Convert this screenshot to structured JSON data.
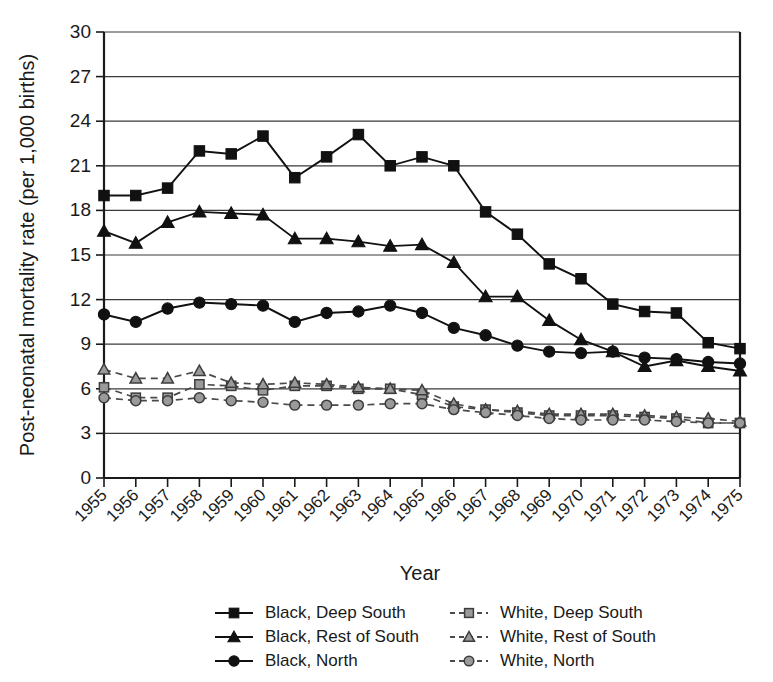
{
  "chart_data": {
    "type": "line",
    "title": "",
    "xlabel": "Year",
    "ylabel": "Post-neonatal mortality rate (per 1,000 births)",
    "x": [
      1955,
      1956,
      1957,
      1958,
      1959,
      1960,
      1961,
      1962,
      1963,
      1964,
      1965,
      1966,
      1967,
      1968,
      1969,
      1970,
      1971,
      1972,
      1973,
      1974,
      1975
    ],
    "categories": [
      "1955",
      "1956",
      "1957",
      "1958",
      "1959",
      "1960",
      "1961",
      "1962",
      "1963",
      "1964",
      "1965",
      "1966",
      "1967",
      "1968",
      "1969",
      "1970",
      "1971",
      "1972",
      "1973",
      "1974",
      "1975"
    ],
    "ylim": [
      0,
      30
    ],
    "yticks": [
      0,
      3,
      6,
      9,
      12,
      15,
      18,
      21,
      24,
      27,
      30
    ],
    "ytick_labels": [
      "0",
      "3",
      "6",
      "9",
      "12",
      "15",
      "18",
      "21",
      "24",
      "27",
      "30"
    ],
    "grid": "horizontal",
    "legend_position": "bottom",
    "series": [
      {
        "name": "Black, Deep South",
        "marker": "square",
        "style": "solid",
        "color": "#111111",
        "values": [
          19.0,
          19.0,
          19.5,
          22.0,
          21.8,
          23.0,
          20.2,
          21.6,
          23.1,
          21.0,
          21.6,
          21.0,
          17.9,
          16.4,
          14.4,
          13.4,
          11.7,
          11.2,
          11.1,
          9.1,
          8.7
        ]
      },
      {
        "name": "Black, Rest of South",
        "marker": "triangle",
        "style": "solid",
        "color": "#111111",
        "values": [
          16.6,
          15.8,
          17.2,
          17.9,
          17.8,
          17.7,
          16.1,
          16.1,
          15.9,
          15.6,
          15.7,
          14.5,
          12.2,
          12.2,
          10.6,
          9.3,
          8.5,
          7.5,
          7.9,
          7.5,
          7.2
        ]
      },
      {
        "name": "Black, North",
        "marker": "circle",
        "style": "solid",
        "color": "#111111",
        "values": [
          11.0,
          10.5,
          11.4,
          11.8,
          11.7,
          11.6,
          10.5,
          11.1,
          11.2,
          11.6,
          11.1,
          10.1,
          9.6,
          8.9,
          8.5,
          8.4,
          8.5,
          8.1,
          8.0,
          7.8,
          7.7
        ]
      },
      {
        "name": "White, Deep South",
        "marker": "square",
        "style": "dashed",
        "color": "#9a9a9a",
        "values": [
          6.1,
          5.4,
          5.4,
          6.3,
          6.2,
          5.9,
          6.2,
          6.2,
          6.0,
          6.0,
          5.6,
          4.8,
          4.6,
          4.4,
          4.2,
          4.2,
          4.2,
          4.1,
          4.0,
          3.7,
          3.7
        ]
      },
      {
        "name": "White, Rest of South",
        "marker": "triangle",
        "style": "dashed",
        "color": "#9a9a9a",
        "values": [
          7.3,
          6.7,
          6.7,
          7.2,
          6.4,
          6.3,
          6.4,
          6.3,
          6.1,
          6.0,
          5.9,
          5.0,
          4.6,
          4.5,
          4.3,
          4.3,
          4.3,
          4.2,
          4.1,
          4.0,
          3.8
        ]
      },
      {
        "name": "White, North",
        "marker": "circle",
        "style": "dashed",
        "color": "#9a9a9a",
        "values": [
          5.4,
          5.2,
          5.2,
          5.4,
          5.2,
          5.1,
          4.9,
          4.9,
          4.9,
          5.0,
          5.0,
          4.6,
          4.4,
          4.2,
          4.0,
          3.9,
          3.9,
          3.9,
          3.8,
          3.7,
          3.7
        ]
      }
    ]
  },
  "legend": {
    "items": [
      {
        "label": "Black, Deep South",
        "marker": "square",
        "style": "solid"
      },
      {
        "label": "Black, Rest of South",
        "marker": "triangle",
        "style": "solid"
      },
      {
        "label": "Black, North",
        "marker": "circle",
        "style": "solid"
      },
      {
        "label": "White, Deep South",
        "marker": "square",
        "style": "dashed"
      },
      {
        "label": "White, Rest of South",
        "marker": "triangle",
        "style": "dashed"
      },
      {
        "label": "White, North",
        "marker": "circle",
        "style": "dashed"
      }
    ]
  }
}
